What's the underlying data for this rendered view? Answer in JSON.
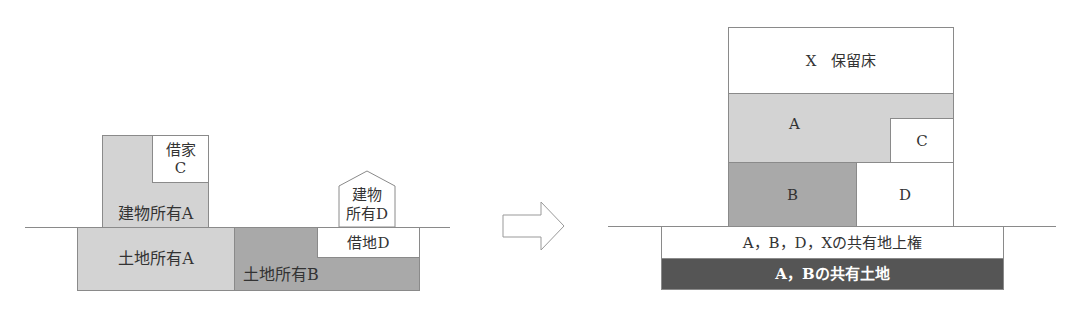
{
  "before": {
    "building_owner_a": "建物所有A",
    "tenant_c_line1": "借家",
    "tenant_c_line2": "C",
    "building_owner_d_line1": "建物",
    "building_owner_d_line2": "所有D",
    "land_owner_a": "土地所有A",
    "land_owner_b": "土地所有B",
    "leasehold_d": "借地D"
  },
  "arrow": {
    "icon": "right-arrow-icon"
  },
  "after": {
    "reserved_floor_x": "X　保留床",
    "unit_a": "A",
    "unit_c": "C",
    "unit_b": "B",
    "unit_d": "D",
    "co_owned_superficies": "A，B，D，Xの共有地上権",
    "co_owned_land": "A，Bの共有土地"
  },
  "colors": {
    "light_gray": "#d3d3d3",
    "mid_gray": "#a9a9a9",
    "dark_gray": "#555555",
    "border": "#8a8a8a"
  }
}
